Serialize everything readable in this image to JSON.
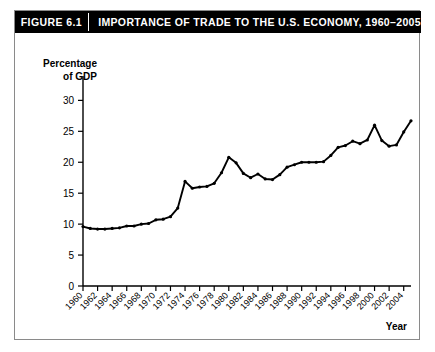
{
  "header": {
    "figure_number": "FIGURE 6.1",
    "title": "IMPORTANCE OF TRADE TO THE U.S. ECONOMY, 1960–2005",
    "background_color": "#000000",
    "text_color": "#ffffff"
  },
  "axes": {
    "y_title_line1": "Percentage",
    "y_title_line2": "of GDP",
    "x_title": "Year"
  },
  "chart_data": {
    "type": "line",
    "title": "IMPORTANCE OF TRADE TO THE U.S. ECONOMY, 1960–2005",
    "xlabel": "Year",
    "ylabel": "Percentage of GDP",
    "xlim": [
      1960,
      2005
    ],
    "ylim": [
      0,
      32
    ],
    "ytick_values": [
      0,
      5,
      10,
      15,
      20,
      25,
      30
    ],
    "ytick_labels": [
      "0",
      "5",
      "10",
      "15",
      "20",
      "25",
      "30"
    ],
    "xtick_values": [
      1960,
      1962,
      1964,
      1966,
      1968,
      1970,
      1972,
      1974,
      1976,
      1978,
      1980,
      1982,
      1984,
      1986,
      1988,
      1990,
      1992,
      1994,
      1996,
      1998,
      2000,
      2002,
      2004
    ],
    "xtick_labels": [
      "1960",
      "1962",
      "1964",
      "1966",
      "1968",
      "1970",
      "1972",
      "1974",
      "1976",
      "1978",
      "1980",
      "1982",
      "1984",
      "1986",
      "1988",
      "1990",
      "1992",
      "1994",
      "1996",
      "1998",
      "2000",
      "2002",
      "2004"
    ],
    "xtick_rotation": -45,
    "grid": false,
    "legend": false,
    "line_color": "#000000",
    "marker": "circle",
    "x": [
      1960,
      1961,
      1962,
      1963,
      1964,
      1965,
      1966,
      1967,
      1968,
      1969,
      1970,
      1971,
      1972,
      1973,
      1974,
      1975,
      1976,
      1977,
      1978,
      1979,
      1980,
      1981,
      1982,
      1983,
      1984,
      1985,
      1986,
      1987,
      1988,
      1989,
      1990,
      1991,
      1992,
      1993,
      1994,
      1995,
      1996,
      1997,
      1998,
      1999,
      2000,
      2001,
      2002,
      2003,
      2004,
      2005
    ],
    "values": [
      9.6,
      9.3,
      9.2,
      9.2,
      9.3,
      9.4,
      9.7,
      9.7,
      10.0,
      10.1,
      10.7,
      10.8,
      11.2,
      12.6,
      16.9,
      15.8,
      16.0,
      16.1,
      16.6,
      18.3,
      20.8,
      19.9,
      18.2,
      17.5,
      18.1,
      17.3,
      17.2,
      18.0,
      19.2,
      19.6,
      20.0,
      20.0,
      20.0,
      20.1,
      21.1,
      22.4,
      22.7,
      23.4,
      23.0,
      23.6,
      26.0,
      23.5,
      22.6,
      22.8,
      24.9,
      26.7
    ]
  }
}
